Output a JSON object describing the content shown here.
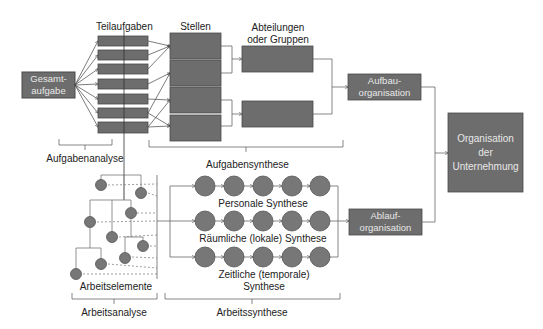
{
  "colors": {
    "box_fill": "#6d6d6d",
    "box_stroke": "#4a4a4a",
    "box_text": "#e8e8e8",
    "circle_fill": "#777777",
    "line": "#555555",
    "text": "#222222"
  },
  "boxes": {
    "gesamtaufgabe": "Gesamt-\naufgabe",
    "gesamtaufgabe_l1": "Gesamt-",
    "gesamtaufgabe_l2": "aufgabe",
    "aufbau_l1": "Aufbau-",
    "aufbau_l2": "organisation",
    "ablauf_l1": "Ablauf-",
    "ablauf_l2": "organisation",
    "org_l1": "Organisation",
    "org_l2": "der",
    "org_l3": "Unternehmung"
  },
  "labels": {
    "teilaufgaben": "Teilaufgaben",
    "stellen": "Stellen",
    "abteilungen_l1": "Abteilungen",
    "abteilungen_l2": "oder Gruppen",
    "aufgabenanalyse": "Aufgabenanalyse",
    "aufgabensynthese": "Aufgabensynthese",
    "personale_synthese": "Personale Synthese",
    "raeumliche_synthese": "Räumliche (lokale) Synthese",
    "zeitliche_l1": "Zeitliche (temporale)",
    "zeitliche_l2": "Synthese",
    "arbeitselemente": "Arbeitselemente",
    "arbeitsanalyse": "Arbeitsanalyse",
    "arbeitssynthese": "Arbeitssynthese"
  },
  "structure": {
    "teilaufgaben_count": 7,
    "stellen_count": 4,
    "abteilungen_count": 2,
    "synthesis_rows": 3,
    "circles_per_row": 5,
    "arbeitselemente_count": 10
  }
}
